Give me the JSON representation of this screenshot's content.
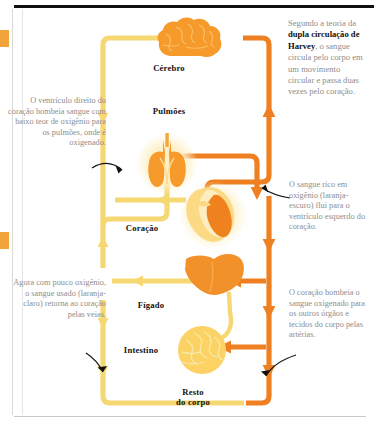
{
  "diagram": {
    "title": "Dupla circulação de Harvey",
    "colors": {
      "oxygenated": "#ef8022",
      "deoxygenated": "#f6d873",
      "organ_orange": "#f59a2b",
      "organ_light": "#fbd985",
      "text_gray": "#8d8d8d",
      "text_dark": "#111111",
      "background": "#ffffff"
    },
    "intro": {
      "line1": "Segundo a teoria",
      "line2": "da ",
      "bold": "dupla circulação de Harvey",
      "rest": ", o sangue circula pelo corpo em um movimento circular e passa duas vezes pelo coração."
    },
    "notes": [
      {
        "id": "note-right-ventricle",
        "side": "left",
        "text": "O ventrículo direito do coração bombeia sangue com baixo teor de oxigênio para os pulmões, onde é oxigenado."
      },
      {
        "id": "note-venous-return",
        "side": "left",
        "text": "Agora com pouco oxigênio, o sangue usado (laranja-claro) retorna ao coração pelas veias."
      },
      {
        "id": "note-oxygen-rich",
        "side": "right",
        "text": "O sangue rico em oxigênio (laranja-escuro) flui para o ventrículo esquerdo do coração."
      },
      {
        "id": "note-arteries",
        "side": "right",
        "text": "O coração bombeia o sangue oxigenado para os outros órgãos e tecidos do corpo pelas artérias."
      }
    ],
    "organs": [
      {
        "id": "brain",
        "label": "Cérebro"
      },
      {
        "id": "lungs",
        "label": "Pulmões"
      },
      {
        "id": "heart",
        "label": "Coração"
      },
      {
        "id": "liver",
        "label": "Fígado"
      },
      {
        "id": "intestine",
        "label": "Intestino"
      },
      {
        "id": "body",
        "label": "Resto\ndo corpo"
      }
    ]
  }
}
